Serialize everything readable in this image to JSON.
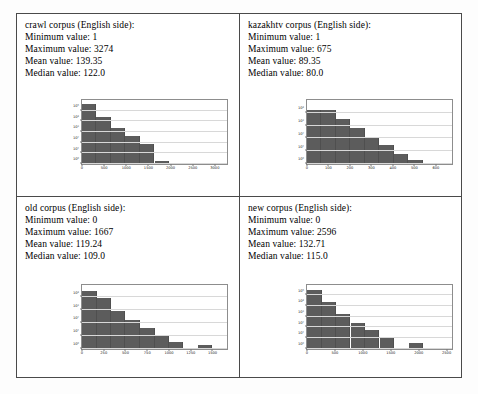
{
  "cells": [
    {
      "id": "crawl",
      "heading": "crawl corpus (English side):",
      "minimum": "Minimum value: 1",
      "maximum": "Maximum value: 3274",
      "mean": "Mean value: 139.35",
      "median": "Median value: 122.0"
    },
    {
      "id": "kazakhtv",
      "heading": "kazakhtv corpus (English side):",
      "minimum": "Minimum value: 1",
      "maximum": "Maximum value: 675",
      "mean": "Mean value: 89.35",
      "median": "Median value: 80.0"
    },
    {
      "id": "old",
      "heading": "old corpus (English side):",
      "minimum": "Minimum value: 0",
      "maximum": "Maximum value: 1667",
      "mean": "Mean value: 119.24",
      "median": "Median value: 109.0"
    },
    {
      "id": "new",
      "heading": "new corpus (English side):",
      "minimum": "Minimum value: 0",
      "maximum": "Maximum value: 2596",
      "mean": "Mean value: 132.71",
      "median": "Median value: 115.0"
    }
  ],
  "chart_data": [
    {
      "id": "crawl-histogram",
      "type": "bar",
      "title": "",
      "xlabel": "",
      "ylabel": "",
      "yscale": "log",
      "grid": true,
      "legend": null,
      "xlim": [
        0,
        3274
      ],
      "ylim": [
        1,
        1000000
      ],
      "xticks": [
        0,
        500,
        1000,
        1500,
        2000,
        2500,
        3000
      ],
      "yticks": [
        1,
        10,
        100,
        1000,
        10000,
        100000
      ],
      "yticklabels": [
        "10⁰",
        "10¹",
        "10²",
        "10³",
        "10⁴",
        "10⁵"
      ],
      "bin_edges": [
        0,
        327,
        655,
        982,
        1310,
        1637,
        1965,
        2292,
        2619,
        2947,
        3274
      ],
      "values": [
        380000,
        24000,
        2600,
        420,
        70,
        2,
        1,
        0,
        0,
        1
      ]
    },
    {
      "id": "kazakhtv-histogram",
      "type": "bar",
      "title": "",
      "xlabel": "",
      "ylabel": "",
      "yscale": "log",
      "grid": true,
      "legend": null,
      "xlim": [
        0,
        675
      ],
      "ylim": [
        1,
        100000
      ],
      "xticks": [
        0,
        100,
        200,
        300,
        400,
        500,
        600,
        700
      ],
      "yticks": [
        1,
        10,
        100,
        1000,
        10000
      ],
      "yticklabels": [
        "10⁰",
        "10¹",
        "10²",
        "10³",
        "10⁴"
      ],
      "bin_edges": [
        0,
        67,
        135,
        202,
        270,
        337,
        405,
        472,
        540,
        607,
        675
      ],
      "values": [
        17000,
        16000,
        3300,
        620,
        130,
        30,
        6,
        2,
        1,
        1
      ]
    },
    {
      "id": "old-histogram",
      "type": "bar",
      "title": "",
      "xlabel": "",
      "ylabel": "",
      "yscale": "log",
      "grid": true,
      "legend": null,
      "xlim": [
        0,
        1667
      ],
      "ylim": [
        1,
        100000
      ],
      "xticks": [
        0,
        250,
        500,
        750,
        1000,
        1250,
        1500,
        1750
      ],
      "yticks": [
        1,
        10,
        100,
        1000,
        10000
      ],
      "yticklabels": [
        "10⁰",
        "10¹",
        "10²",
        "10³",
        "10⁴"
      ],
      "bin_edges": [
        0,
        167,
        333,
        500,
        667,
        834,
        1000,
        1167,
        1334,
        1500,
        1667
      ],
      "values": [
        33000,
        9000,
        900,
        180,
        40,
        11,
        3,
        1,
        2,
        1
      ]
    },
    {
      "id": "new-histogram",
      "type": "bar",
      "title": "",
      "xlabel": "",
      "ylabel": "",
      "yscale": "log",
      "grid": true,
      "legend": null,
      "xlim": [
        0,
        2596
      ],
      "ylim": [
        1,
        1000000
      ],
      "xticks": [
        0,
        500,
        1000,
        1500,
        2000,
        2500
      ],
      "yticks": [
        1,
        10,
        100,
        1000,
        10000,
        100000
      ],
      "yticklabels": [
        "10⁰",
        "10¹",
        "10²",
        "10³",
        "10⁴",
        "10⁵"
      ],
      "bin_edges": [
        0,
        260,
        520,
        779,
        1039,
        1298,
        1558,
        1818,
        2077,
        2337,
        2596
      ],
      "values": [
        300000,
        22000,
        1600,
        260,
        60,
        12,
        0,
        3,
        0,
        1
      ]
    }
  ],
  "colors": {
    "bar": "#5c5c5c",
    "grid": "#d8d8d8",
    "frame": "#8d8d8d",
    "table_border": "#4a4a4a",
    "background": "#ffffff"
  }
}
